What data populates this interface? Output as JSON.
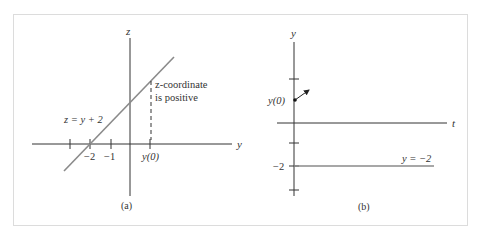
{
  "figure": {
    "panel_a": {
      "caption": "(a)",
      "axis_vertical_label": "z",
      "axis_horizontal_label": "y",
      "line_label": "z = y + 2",
      "tick_labels": [
        "−2",
        "−1"
      ],
      "point_label": "y(0)",
      "annotation_line1": "z-coordinate",
      "annotation_line2": "is positive"
    },
    "panel_b": {
      "caption": "(b)",
      "axis_vertical_label": "y",
      "axis_horizontal_label": "t",
      "point_label": "y(0)",
      "tick_label": "−2",
      "line_label": "y = −2"
    },
    "colors": {
      "axis": "#333333",
      "graph_line": "#8a8a8a",
      "frame": "#dcdcdc"
    }
  }
}
